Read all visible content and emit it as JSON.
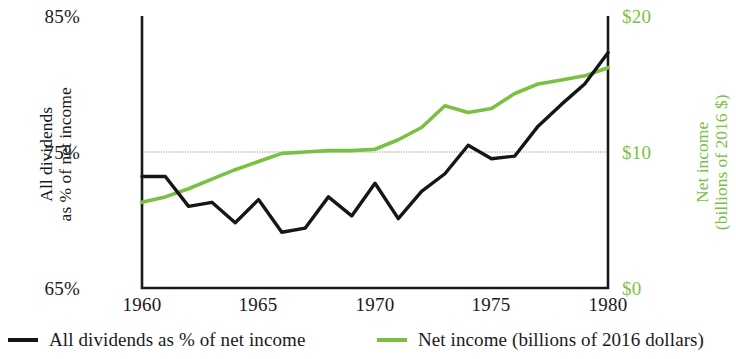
{
  "chart_data": {
    "type": "line",
    "title": "",
    "subtitle": "",
    "xlabel": "",
    "xlim": [
      1960,
      1980
    ],
    "xticks": [
      "1960",
      "1965",
      "1970",
      "1975",
      "1980"
    ],
    "xtick_values": [
      1960,
      1965,
      1970,
      1975,
      1980
    ],
    "grid": "single horizontal gridline at 75% / $10",
    "gridline_value": 75,
    "legend_position": "below-plot",
    "axes": [
      {
        "side": "left",
        "label": "All dividends as % of net income",
        "label_lines": [
          "All dividends",
          "as % of net income"
        ],
        "ticks": [
          "85%",
          "75%",
          "65%"
        ],
        "tick_values": [
          85,
          75,
          65
        ],
        "lim": [
          65,
          85
        ],
        "color": "#1a1a1a"
      },
      {
        "side": "right",
        "label": "Net income (billions of 2016 $)",
        "label_lines": [
          "Net income",
          "(billions of 2016 $)"
        ],
        "ticks": [
          "$20",
          "$10",
          "$0"
        ],
        "tick_values": [
          20,
          10,
          0
        ],
        "lim": [
          0,
          20
        ],
        "color": "#7ac143"
      }
    ],
    "series": [
      {
        "name": "All dividends as % of net income",
        "axis": "left",
        "color": "#161616",
        "x": [
          1960,
          1961,
          1962,
          1963,
          1964,
          1965,
          1966,
          1967,
          1968,
          1969,
          1970,
          1971,
          1972,
          1973,
          1974,
          1975,
          1976,
          1977,
          1978,
          1979,
          1980
        ],
        "values": [
          73.2,
          73.2,
          71.0,
          71.3,
          69.8,
          71.5,
          69.1,
          69.4,
          71.7,
          70.3,
          72.7,
          70.1,
          72.1,
          73.4,
          75.5,
          74.5,
          74.7,
          76.9,
          78.5,
          80.0,
          82.3
        ]
      },
      {
        "name": "Net income (billions of 2016 dollars)",
        "axis": "right",
        "color": "#7ac143",
        "x": [
          1960,
          1961,
          1962,
          1963,
          1964,
          1965,
          1966,
          1967,
          1968,
          1969,
          1970,
          1971,
          1972,
          1973,
          1974,
          1975,
          1976,
          1977,
          1978,
          1979,
          1980
        ],
        "values": [
          6.3,
          6.7,
          7.3,
          8.0,
          8.7,
          9.3,
          9.9,
          10.0,
          10.1,
          10.1,
          10.2,
          10.9,
          11.8,
          13.4,
          12.9,
          13.2,
          14.3,
          15.0,
          15.3,
          15.6,
          16.2
        ]
      }
    ],
    "legend": [
      {
        "label": "All dividends as % of net income",
        "color": "#161616"
      },
      {
        "label": "Net income (billions of 2016 dollars)",
        "color": "#7ac143"
      }
    ]
  },
  "colors": {
    "black_series": "#161616",
    "green_series": "#7ac143",
    "gridline": "#9a9a9a",
    "frame": "#1a1a1a",
    "background": "#ffffff"
  }
}
